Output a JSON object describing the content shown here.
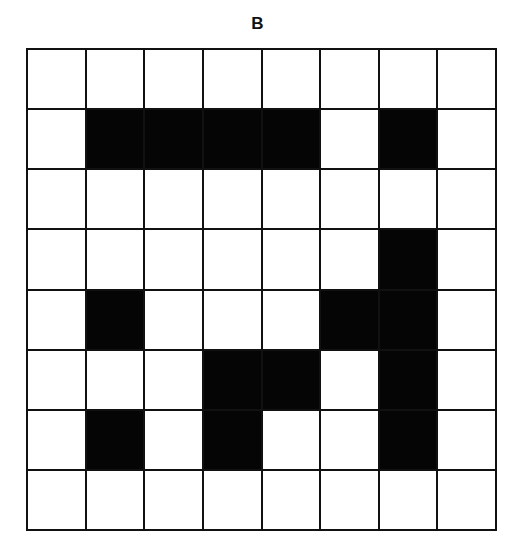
{
  "title": "B",
  "grid": {
    "rows": 8,
    "cols": 8,
    "fill_color": "#050505",
    "empty_color": "#ffffff",
    "line_color": "#111111",
    "cells": [
      [
        0,
        0,
        0,
        0,
        0,
        0,
        0,
        0
      ],
      [
        0,
        1,
        1,
        1,
        1,
        0,
        1,
        0
      ],
      [
        0,
        0,
        0,
        0,
        0,
        0,
        0,
        0
      ],
      [
        0,
        0,
        0,
        0,
        0,
        0,
        1,
        0
      ],
      [
        0,
        1,
        0,
        0,
        0,
        1,
        1,
        0
      ],
      [
        0,
        0,
        0,
        1,
        1,
        0,
        1,
        0
      ],
      [
        0,
        1,
        0,
        1,
        0,
        0,
        1,
        0
      ],
      [
        0,
        0,
        0,
        0,
        0,
        0,
        0,
        0
      ]
    ]
  }
}
